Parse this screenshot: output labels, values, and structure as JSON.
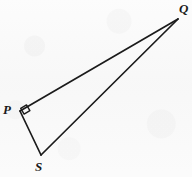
{
  "figure": {
    "kind": "geometry-diagram",
    "background_color": "#f8f8f8",
    "stroke_color": "#1b1b1b",
    "label_color": "#1b1b1b",
    "canvas": {
      "width": 192,
      "height": 177
    }
  },
  "vertices": [
    {
      "id": "P",
      "label": "P",
      "x": 20,
      "y": 111,
      "label_x": 3,
      "label_y": 103
    },
    {
      "id": "Q",
      "label": "Q",
      "x": 178,
      "y": 19,
      "label_x": 179,
      "label_y": 2
    },
    {
      "id": "S",
      "label": "S",
      "x": 41,
      "y": 155,
      "label_x": 35,
      "label_y": 160
    }
  ],
  "segments": [
    {
      "id": "PQ",
      "from": "P",
      "to": "Q",
      "x1": 20,
      "y1": 111,
      "x2": 178,
      "y2": 19,
      "stroke_width": 1.7
    },
    {
      "id": "PS",
      "from": "P",
      "to": "S",
      "x1": 20,
      "y1": 111,
      "x2": 41,
      "y2": 155,
      "stroke_width": 1.7
    },
    {
      "id": "SQ",
      "from": "S",
      "to": "Q",
      "x1": 41,
      "y1": 155,
      "x2": 178,
      "y2": 19,
      "stroke_width": 1.7
    }
  ],
  "angle_markers": [
    {
      "id": "right-angle-P",
      "at_vertex": "P",
      "type": "right-angle-square",
      "points": "24.1,114.1 29.9,110.7 26.5,104.9 20.7,108.3",
      "stroke_width": 1.4
    }
  ]
}
